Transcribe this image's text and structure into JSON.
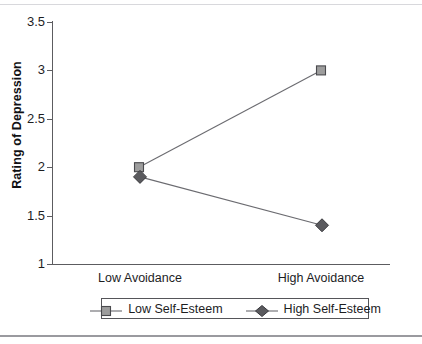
{
  "chart_data": {
    "type": "line",
    "title": "",
    "subtitle": "",
    "xlabel": "",
    "ylabel": "Rating of Depression",
    "categories": [
      "Low Avoidance",
      "High Avoidance"
    ],
    "ylim": [
      1,
      3.5
    ],
    "ytick_labels": [
      "3.5",
      "3",
      "2.5",
      "2",
      "1.5",
      "1"
    ],
    "ytick_values": [
      3.5,
      3,
      2.5,
      2,
      1.5,
      1
    ],
    "grid": false,
    "legend_position": "below-axes",
    "series": [
      {
        "name": "Low Self-Esteem",
        "values": [
          2.0,
          3.0
        ],
        "marker": "square",
        "marker_fill": "#9d9d9d",
        "marker_edge": "#4a4a4e",
        "line_color": "#6b6b70"
      },
      {
        "name": "High Self-Esteem",
        "values": [
          1.9,
          1.4
        ],
        "marker": "diamond",
        "marker_fill": "#5a5a5e",
        "marker_edge": "#3a3a3e",
        "line_color": "#6b6b70"
      }
    ]
  },
  "axes": {
    "y_title": "Rating of Depression",
    "ticks": [
      {
        "label": "3.5"
      },
      {
        "label": "3"
      },
      {
        "label": "2.5"
      },
      {
        "label": "2"
      },
      {
        "label": "1.5"
      },
      {
        "label": "1"
      }
    ],
    "categories": [
      {
        "label": "Low Avoidance"
      },
      {
        "label": "High Avoidance"
      }
    ]
  },
  "legend": {
    "items": [
      {
        "label": "Low Self-Esteem"
      },
      {
        "label": "High Self-Esteem"
      }
    ]
  },
  "colors": {
    "axis": "#5c5c60",
    "line": "#6b6b70",
    "square_fill": "#9d9d9d",
    "diamond_fill": "#5a5a5e",
    "text": "#1d1d1f"
  }
}
